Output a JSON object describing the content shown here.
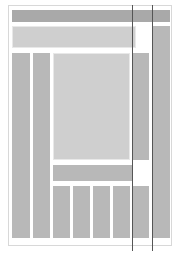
{
  "diagram": {
    "type": "wireframe-layout",
    "colors": {
      "dark_block": "#a9a9a9",
      "mid_block": "#b8b8b8",
      "light_block": "#cfcfcf",
      "guide_line": "#555555",
      "frame": "#d8d8d8"
    },
    "blocks": [
      {
        "id": "top-bar",
        "x": 12,
        "y": 10,
        "w": 158,
        "h": 12
      },
      {
        "id": "header-band",
        "x": 12,
        "y": 26,
        "w": 124,
        "h": 22
      },
      {
        "id": "left-col-1",
        "x": 12,
        "y": 53,
        "w": 18,
        "h": 185
      },
      {
        "id": "left-col-2",
        "x": 33,
        "y": 53,
        "w": 17,
        "h": 185
      },
      {
        "id": "center-panel",
        "x": 53,
        "y": 53,
        "w": 77,
        "h": 107
      },
      {
        "id": "right-inner-col",
        "x": 132,
        "y": 53,
        "w": 17,
        "h": 107
      },
      {
        "id": "bottom-bar",
        "x": 53,
        "y": 165,
        "w": 79,
        "h": 16
      },
      {
        "id": "bottom-col-1",
        "x": 53,
        "y": 186,
        "w": 17,
        "h": 52
      },
      {
        "id": "bottom-col-2",
        "x": 73,
        "y": 186,
        "w": 17,
        "h": 52
      },
      {
        "id": "bottom-col-3",
        "x": 93,
        "y": 186,
        "w": 17,
        "h": 52
      },
      {
        "id": "bottom-col-4",
        "x": 113,
        "y": 186,
        "w": 17,
        "h": 52
      },
      {
        "id": "bottom-col-5",
        "x": 133,
        "y": 186,
        "w": 16,
        "h": 52
      },
      {
        "id": "far-right-col",
        "x": 152,
        "y": 26,
        "w": 18,
        "h": 212
      }
    ],
    "guide_lines_x": [
      132,
      152
    ]
  }
}
